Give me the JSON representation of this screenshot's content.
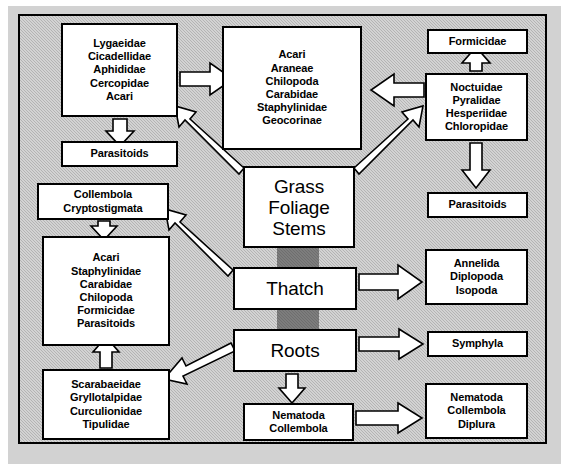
{
  "diagram": {
    "frame": {
      "border_color": "#000000",
      "background_color": "#b4b4b4"
    },
    "resource_link_color": "#6e6e6e",
    "node_fill": "#ffffff",
    "arrow_fill": "#ffffff",
    "arrow_stroke": "#000000"
  },
  "nodes": [
    {
      "id": "sap-feeders",
      "name": "sap-feeder-taxa-box",
      "lines": [
        "Lygaeidae",
        "Cicadellidae",
        "Aphididae",
        "Cercopidae",
        "Acari"
      ],
      "x": 61,
      "y": 23,
      "w": 117,
      "h": 94,
      "size": "small"
    },
    {
      "id": "parasitoids-upper-left",
      "name": "parasitoids-upper-left-box",
      "lines": [
        "Parasitoids"
      ],
      "x": 61,
      "y": 141,
      "w": 117,
      "h": 26,
      "size": "small"
    },
    {
      "id": "foliage-predators",
      "name": "foliage-predator-taxa-box",
      "lines": [
        "Acari",
        "Araneae",
        "Chilopoda",
        "Carabidae",
        "Staphylinidae",
        "Geocorinae"
      ],
      "x": 222,
      "y": 26,
      "w": 140,
      "h": 124,
      "size": "small"
    },
    {
      "id": "formicidae",
      "name": "formicidae-box",
      "lines": [
        "Formicidae"
      ],
      "x": 427,
      "y": 29,
      "w": 101,
      "h": 25,
      "size": "small"
    },
    {
      "id": "lepidoptera-diptera",
      "name": "chewing-herbivore-taxa-box",
      "lines": [
        "Noctuidae",
        "Pyralidae",
        "Hesperiidae",
        "Chloropidae"
      ],
      "x": 425,
      "y": 73,
      "w": 103,
      "h": 68,
      "size": "small"
    },
    {
      "id": "parasitoids-right",
      "name": "parasitoids-right-box",
      "lines": [
        "Parasitoids"
      ],
      "x": 427,
      "y": 192,
      "w": 101,
      "h": 26,
      "size": "small"
    },
    {
      "id": "grass-foliage-stems",
      "name": "grass-foliage-stems-resource-box",
      "lines": [
        "Grass",
        "Foliage",
        "Stems"
      ],
      "x": 243,
      "y": 166,
      "w": 112,
      "h": 82,
      "size": "big"
    },
    {
      "id": "collembola-cryptostigmata",
      "name": "collembola-cryptostigmata-box",
      "lines": [
        "Collembola",
        "Cryptostigmata"
      ],
      "x": 37,
      "y": 183,
      "w": 132,
      "h": 37,
      "size": "small"
    },
    {
      "id": "thatch-predators",
      "name": "thatch-predator-taxa-box",
      "lines": [
        "Acari",
        "Staphylinidae",
        "Carabidae",
        "Chilopoda",
        "Formicidae",
        "Parasitoids"
      ],
      "x": 42,
      "y": 236,
      "w": 128,
      "h": 110,
      "size": "small"
    },
    {
      "id": "thatch",
      "name": "thatch-resource-box",
      "lines": [
        "Thatch"
      ],
      "x": 233,
      "y": 267,
      "w": 124,
      "h": 43,
      "size": "big"
    },
    {
      "id": "annelida-diplopoda-isopoda",
      "name": "detritivore-taxa-box",
      "lines": [
        "Annelida",
        "Diplopoda",
        "Isopoda"
      ],
      "x": 425,
      "y": 249,
      "w": 103,
      "h": 56,
      "size": "small"
    },
    {
      "id": "roots",
      "name": "roots-resource-box",
      "lines": [
        "Roots"
      ],
      "x": 233,
      "y": 329,
      "w": 124,
      "h": 43,
      "size": "big"
    },
    {
      "id": "symphyla",
      "name": "symphyla-box",
      "lines": [
        "Symphyla"
      ],
      "x": 427,
      "y": 331,
      "w": 101,
      "h": 26,
      "size": "small"
    },
    {
      "id": "root-feeders",
      "name": "root-feeder-taxa-box",
      "lines": [
        "Scarabaeidae",
        "Gryllotalpidae",
        "Curculionidae",
        "Tipulidae"
      ],
      "x": 42,
      "y": 369,
      "w": 128,
      "h": 71,
      "size": "small"
    },
    {
      "id": "nematoda-collembola",
      "name": "nematoda-collembola-box",
      "lines": [
        "Nematoda",
        "Collembola"
      ],
      "x": 243,
      "y": 403,
      "w": 111,
      "h": 38,
      "size": "small"
    },
    {
      "id": "nematoda-collembola-diplura",
      "name": "nematoda-collembola-diplura-box",
      "lines": [
        "Nematoda",
        "Collembola",
        "Diplura"
      ],
      "x": 425,
      "y": 383,
      "w": 103,
      "h": 56,
      "size": "small"
    }
  ],
  "resource_links": [
    {
      "name": "grass-to-thatch-link",
      "x": 277,
      "y": 248,
      "w": 42,
      "h": 20
    },
    {
      "name": "thatch-to-roots-link",
      "x": 277,
      "y": 310,
      "w": 42,
      "h": 20
    }
  ],
  "arrows": [
    {
      "name": "arrow-sapfeeders-to-foliage-predators",
      "from": "sap-feeders",
      "to": "foliage-predators",
      "direction": "right",
      "points": "180,72 210,72 210,64 232,79 210,94 210,86 180,86"
    },
    {
      "name": "arrow-sapfeeders-to-parasitoids",
      "from": "sap-feeders",
      "to": "parasitoids-upper-left",
      "direction": "down",
      "points": "113,119 127,119 127,132 134,132 120,146 106,132 113,132"
    },
    {
      "name": "arrow-grass-to-sapfeeders",
      "from": "grass-foliage-stems",
      "to": "sap-feeders",
      "direction": "up-left",
      "points": "241,170 183,117 190,110 176,105 178,120 185,113 236,178"
    },
    {
      "name": "arrow-chewers-to-foliage-predators",
      "from": "lepidoptera-diptera",
      "to": "foliage-predators",
      "direction": "left",
      "points": "423,83 393,83 393,75 371,90 393,105 393,97 423,97"
    },
    {
      "name": "arrow-chewers-to-formicidae",
      "from": "lepidoptera-diptera",
      "to": "formicidae",
      "direction": "up",
      "points": "470,71 470,62 463,62 476,48 489,62 482,62 482,71"
    },
    {
      "name": "arrow-chewers-to-parasitoids-right",
      "from": "lepidoptera-diptera",
      "to": "parasitoids-right",
      "direction": "down",
      "points": "470,143 482,143 482,170 489,170 476,186 463,170 470,170"
    },
    {
      "name": "arrow-grass-to-chewers",
      "from": "grass-foliage-stems",
      "to": "lepidoptera-diptera",
      "direction": "up-right",
      "points": "357,170 415,117 408,110 422,105 420,120 413,113 362,178"
    },
    {
      "name": "arrow-thatch-to-collembola",
      "from": "thatch",
      "to": "collembola-cryptostigmata",
      "direction": "up-left",
      "points": "231,272 172,219 179,212 165,207 167,222 174,215 226,280"
    },
    {
      "name": "arrow-collembola-to-thatch-predators",
      "from": "collembola-cryptostigmata",
      "to": "thatch-predators",
      "direction": "down",
      "points": "98,222 110,222 110,225 117,225 104,239 91,225 98,225"
    },
    {
      "name": "arrow-thatch-to-detritivores",
      "from": "thatch",
      "to": "annelida-diplopoda-isopoda",
      "direction": "right",
      "points": "359,274 398,274 398,266 422,282 398,298 398,290 359,290"
    },
    {
      "name": "arrow-roots-to-symphyla",
      "from": "roots",
      "to": "symphyla",
      "direction": "right",
      "points": "359,337 398,337 398,330 422,344 398,358 398,351 359,351"
    },
    {
      "name": "arrow-roots-to-root-feeders",
      "from": "roots",
      "to": "root-feeders",
      "direction": "left-down",
      "points": "231,345 185,368 181,360 166,378 188,382 184,374 235,353"
    },
    {
      "name": "arrow-root-feeders-to-thatch-predators",
      "from": "root-feeders",
      "to": "thatch-predators",
      "direction": "up",
      "points": "100,367 112,367 112,352 119,352 106,338 93,352 100,352"
    },
    {
      "name": "arrow-roots-to-nematoda",
      "from": "roots",
      "to": "nematoda-collembola",
      "direction": "down",
      "points": "286,374 298,374 298,388 305,388 292,402 279,388 286,388"
    },
    {
      "name": "arrow-nematoda-to-nematoda-diplura",
      "from": "nematoda-collembola",
      "to": "nematoda-collembola-diplura",
      "direction": "right",
      "points": "356,411 398,411 398,404 422,418 398,432 398,425 356,425"
    }
  ]
}
